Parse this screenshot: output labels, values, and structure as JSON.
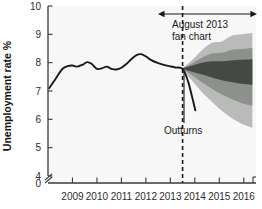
{
  "chart_data": {
    "type": "area",
    "title": "",
    "xlabel": "",
    "ylabel": "Unemployment rate %",
    "xlim": [
      2008.0,
      2016.5
    ],
    "ylim": [
      4,
      10
    ],
    "y_axis_break": true,
    "y_break_label": "0",
    "grid": false,
    "legend_position": "none",
    "yticks": [
      "10",
      "9",
      "8",
      "7",
      "6",
      "5",
      "4",
      "0"
    ],
    "ytick_values": [
      10,
      9,
      8,
      7,
      6,
      5,
      4,
      0
    ],
    "xticks": [
      "2009",
      "2010",
      "2011",
      "2012",
      "2013",
      "2014",
      "2015",
      "2016"
    ],
    "xtick_values": [
      2009,
      2010,
      2011,
      2012,
      2013,
      2014,
      2015,
      2016
    ],
    "forecast_start": 2013.5,
    "annotations": [
      {
        "name": "fan-chart-label",
        "text_line1": "August 2013",
        "text_line2": "fan chart",
        "x": 2014.6,
        "y": 9.35
      },
      {
        "name": "outturns-label",
        "text": "Outturns",
        "x": 2013.6,
        "y": 5.6
      }
    ],
    "series": [
      {
        "name": "Outturns",
        "type": "line",
        "color": "#1a1a1a",
        "x": [
          2008.05,
          2008.25,
          2008.45,
          2008.62,
          2008.8,
          2009.0,
          2009.2,
          2009.42,
          2009.6,
          2009.78,
          2010.0,
          2010.2,
          2010.4,
          2010.6,
          2010.8,
          2011.0,
          2011.2,
          2011.4,
          2011.6,
          2011.8,
          2012.0,
          2012.2,
          2012.45,
          2012.7,
          2012.95,
          2013.2,
          2013.5,
          2013.72,
          2013.9,
          2014.02
        ],
        "values": [
          7.1,
          7.35,
          7.62,
          7.8,
          7.88,
          7.9,
          7.86,
          7.93,
          8.02,
          7.96,
          7.78,
          7.8,
          7.86,
          7.78,
          7.76,
          7.82,
          7.95,
          8.12,
          8.26,
          8.3,
          8.22,
          8.1,
          8.0,
          7.93,
          7.88,
          7.83,
          7.78,
          7.35,
          6.75,
          6.32
        ]
      }
    ],
    "fan_bands": [
      {
        "name": "outer-band",
        "color": "#b9bbb9",
        "percentile": "90%",
        "x": [
          2013.5,
          2013.9,
          2014.3,
          2014.7,
          2015.1,
          2015.5,
          2015.9,
          2016.35
        ],
        "upper": [
          7.8,
          8.1,
          8.45,
          8.7,
          8.75,
          8.95,
          9.0,
          9.05
        ],
        "lower": [
          7.78,
          7.35,
          6.95,
          6.62,
          6.3,
          6.05,
          5.85,
          5.7
        ]
      },
      {
        "name": "middle-band",
        "color": "#8d908d",
        "percentile": "60%",
        "x": [
          2013.5,
          2013.9,
          2014.3,
          2014.7,
          2015.1,
          2015.5,
          2015.9,
          2016.35
        ],
        "upper": [
          7.8,
          7.98,
          8.18,
          8.32,
          8.35,
          8.45,
          8.48,
          8.52
        ],
        "lower": [
          7.78,
          7.55,
          7.3,
          7.08,
          6.88,
          6.72,
          6.58,
          6.48
        ]
      },
      {
        "name": "inner-band",
        "color": "#454845",
        "percentile": "30%",
        "x": [
          2013.5,
          2013.9,
          2014.3,
          2014.7,
          2015.1,
          2015.5,
          2015.9,
          2016.35
        ],
        "upper": [
          7.8,
          7.9,
          8.0,
          8.05,
          8.05,
          8.08,
          8.1,
          8.12
        ],
        "lower": [
          7.78,
          7.68,
          7.58,
          7.48,
          7.38,
          7.32,
          7.26,
          7.22
        ]
      }
    ]
  }
}
